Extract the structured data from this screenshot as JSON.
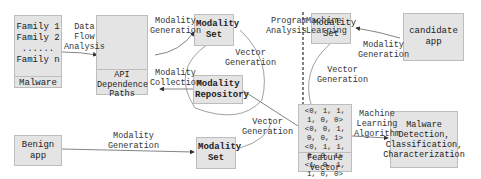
{
  "malware_box": {
    "families": [
      "Family 1",
      "Family 2",
      "......",
      "Family n"
    ],
    "label": "Malware"
  },
  "api_box": {
    "label": "API Dependence Paths"
  },
  "modality_set_top": {
    "label": "Modality Set"
  },
  "modality_repository": {
    "label": "Modality Repository"
  },
  "modality_set_bottom": {
    "label": "Modality Set"
  },
  "modality_set_right": {
    "label": "Modality Set"
  },
  "candidate_app": {
    "label": "candidate app"
  },
  "benign_app": {
    "label": "Benign app"
  },
  "feature_vector": {
    "vectors": [
      "<0, 1, 1, 1, 0, 0>",
      "<0, 0, 1, 0, 0, 1>",
      "<0, 1, 1, 0, 0, 1>",
      "<1, 0, 1, 1, 0, 0>"
    ],
    "label": "Feature Vector"
  },
  "result_box": {
    "lines": [
      "Malware",
      "Detection,",
      "Classification,",
      "Characterization"
    ]
  },
  "edge_labels": {
    "data_flow_analysis": [
      "Data",
      "Flow",
      "Analysis"
    ],
    "modality_generation_top": [
      "Modality",
      "Generation"
    ],
    "modality_collection": [
      "Modality",
      "Collection"
    ],
    "vector_generation_mid": [
      "Vector",
      "Generation"
    ],
    "vector_generation_bottom": [
      "Vector",
      "Generation"
    ],
    "modality_generation_benign": [
      "Modality",
      "Generation"
    ],
    "modality_generation_candidate": [
      "Modality",
      "Generation"
    ],
    "vector_generation_right": [
      "Vector",
      "Generation"
    ],
    "machine_learning_algorithm": [
      "Machine",
      "Learning",
      "Algorithm"
    ]
  },
  "sections": {
    "left": [
      "Program",
      "Analysis"
    ],
    "right": [
      "Machine",
      "Learning"
    ]
  },
  "colors": {
    "box_fill": "#e4e4e4",
    "box_border": "#bdbdbd",
    "line": "#555555"
  }
}
